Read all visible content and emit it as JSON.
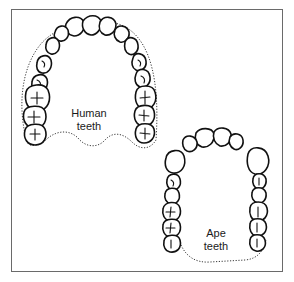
{
  "figure": {
    "type": "comparison-diagram",
    "panels": [
      {
        "id": "human",
        "label_line1": "Human",
        "label_line2": "teeth",
        "arch_shape": "parabolic / rounded U"
      },
      {
        "id": "ape",
        "label_line1": "Ape",
        "label_line2": "teeth",
        "arch_shape": "rectangular U with parallel tooth rows"
      }
    ]
  },
  "colors": {
    "background": "#ffffff",
    "frame": "#6a6a6a",
    "ink": "#111111"
  }
}
